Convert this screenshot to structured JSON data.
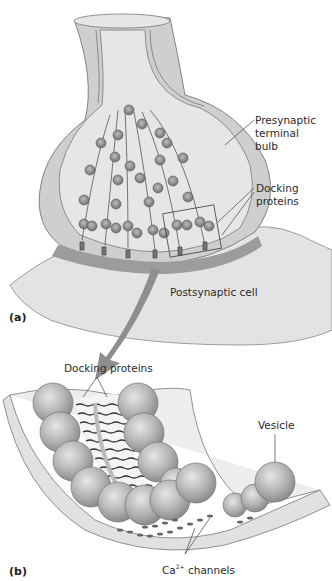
{
  "figure": {
    "panel_a": {
      "panel_label": "(a)",
      "labels": {
        "presynaptic": "Presynaptic\nterminal\nbulb",
        "docking": "Docking\nproteins",
        "postsynaptic": "Postsynaptic cell"
      }
    },
    "panel_b": {
      "panel_label": "(b)",
      "labels": {
        "docking": "Docking proteins",
        "vesicle": "Vesicle",
        "ca_prefix": "Ca",
        "ca_sup": "2+",
        "ca_suffix": " channels"
      }
    },
    "colors": {
      "membrane": "#c8c8c8",
      "cytoplasm": "#e4e4e4",
      "vesicle": "#9a9a9a",
      "arrow": "#8e8e8e",
      "cleft": "#9c9c9c"
    }
  }
}
